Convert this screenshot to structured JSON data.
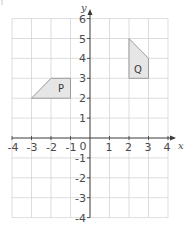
{
  "diagram": {
    "type": "coordinate-grid",
    "x_axis": {
      "label": "x",
      "min": -4,
      "max": 4,
      "ticks": [
        "-4",
        "-3",
        "-2",
        "-1",
        "1",
        "2",
        "3",
        "4"
      ]
    },
    "y_axis": {
      "label": "y",
      "min": -4,
      "max": 6,
      "ticks": [
        "6",
        "5",
        "4",
        "3",
        "2",
        "1",
        "-1",
        "-2",
        "-3",
        "-4"
      ]
    },
    "origin_label": "0",
    "shapes": [
      {
        "name": "P",
        "vertices": [
          [
            -3,
            2
          ],
          [
            -2,
            3
          ],
          [
            -1,
            3
          ],
          [
            -1,
            2
          ]
        ]
      },
      {
        "name": "Q",
        "vertices": [
          [
            2,
            5
          ],
          [
            3,
            4
          ],
          [
            3,
            3
          ],
          [
            2,
            3
          ]
        ]
      }
    ],
    "colors": {
      "grid": "#d4d4d4",
      "axis": "#3a3a3a",
      "shape_fill": "#e6e6e6",
      "shape_stroke": "#9a9a9a"
    }
  }
}
